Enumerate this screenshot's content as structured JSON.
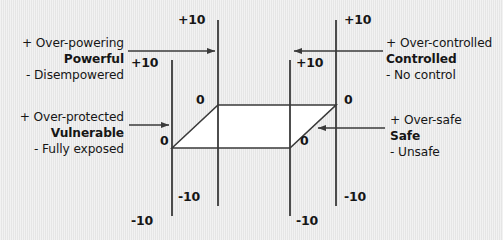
{
  "diagram": {
    "background_color": "#e9e9e9",
    "line_color": "#3a3a3a",
    "face_fill": "#ffffff",
    "text_color": "#161616"
  },
  "axes": [
    {
      "id": "axis-left-front",
      "x": 172,
      "top_label": "+10",
      "zero_label": "0",
      "bottom_label": "-10"
    },
    {
      "id": "axis-left-back",
      "x": 218,
      "top_label": "+10",
      "zero_label": "0",
      "bottom_label": "-10"
    },
    {
      "id": "axis-right-front",
      "x": 288,
      "top_label": "+10",
      "zero_label": "0",
      "bottom_label": "-10"
    },
    {
      "id": "axis-right-back",
      "x": 336,
      "top_label": "+10",
      "zero_label": "0",
      "bottom_label": "-10"
    }
  ],
  "axis_labels": {
    "back_left_top": "+10",
    "back_left_bottom": "-10",
    "front_left_top": "+10",
    "front_left_bottom": "-10",
    "back_right_top": "+10",
    "back_right_bottom": "-10",
    "front_right_top": "+10",
    "front_right_bottom": "-10",
    "zero_back_left": "0",
    "zero_front_left": "0",
    "zero_back_right": "0",
    "zero_front_right": "0"
  },
  "callouts": [
    {
      "id": "callout-powerful",
      "align": "right",
      "positive": "+ Over-powering",
      "core": "Powerful",
      "negative": "- Disempowered",
      "arrow": "arrow-right"
    },
    {
      "id": "callout-controlled",
      "align": "left",
      "positive": "+ Over-controlled",
      "core": "Controlled",
      "negative": "- No control",
      "arrow": "arrow-left"
    },
    {
      "id": "callout-vulnerable",
      "align": "right",
      "positive": "+ Over-protected",
      "core": "Vulnerable",
      "negative": "- Fully exposed",
      "arrow": "arrow-right"
    },
    {
      "id": "callout-safe",
      "align": "left",
      "positive": "+ Over-safe",
      "core": "Safe",
      "negative": "- Unsafe",
      "arrow": "arrow-left"
    }
  ]
}
